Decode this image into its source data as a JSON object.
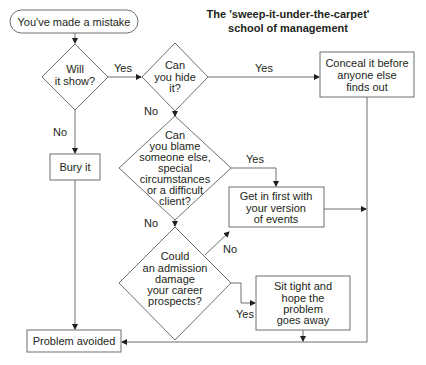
{
  "title": {
    "line1": "The 'sweep-it-under-the-carpet'",
    "line2": "school of management"
  },
  "nodes": {
    "start": {
      "label": "You've made a mistake"
    },
    "will_it_show": {
      "lines": [
        "Will",
        "it show?"
      ]
    },
    "can_you_hide": {
      "lines": [
        "Can",
        "you hide",
        "it?"
      ]
    },
    "conceal": {
      "lines": [
        "Conceal it before",
        "anyone else",
        "finds out"
      ]
    },
    "bury": {
      "label": "Bury it"
    },
    "can_you_blame": {
      "lines": [
        "Can",
        "you blame",
        "someone else,",
        "special",
        "circumstances",
        "or a difficult",
        "client?"
      ]
    },
    "get_in_first": {
      "lines": [
        "Get in first with",
        "your version",
        "of events"
      ]
    },
    "could_admission": {
      "lines": [
        "Could",
        "an admission",
        "damage",
        "your career",
        "prospects?"
      ]
    },
    "sit_tight": {
      "lines": [
        "Sit tight and",
        "hope the",
        "problem",
        "goes away"
      ]
    },
    "problem_avoided": {
      "label": "Problem avoided"
    }
  },
  "edges": {
    "show_yes": "Yes",
    "show_no": "No",
    "hide_yes": "Yes",
    "hide_no": "No",
    "blame_yes": "Yes",
    "blame_no": "No",
    "admission_no": "No",
    "admission_yes": "Yes"
  },
  "colors": {
    "line": "#6d6e71",
    "text": "#231f20",
    "background": "#ffffff"
  }
}
